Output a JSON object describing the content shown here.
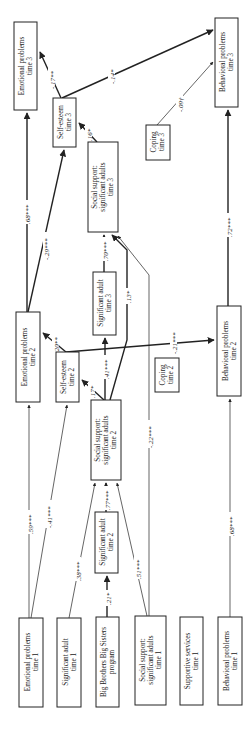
{
  "diagram": {
    "orientation": "rotated 90 degrees counter-clockwise",
    "nodes": [
      {
        "id": "ep3",
        "line1": "Emotional problems",
        "line2": "time 3"
      },
      {
        "id": "se3",
        "line1": "Self-esteem",
        "line2": "time 3"
      },
      {
        "id": "ss3",
        "line1": "Social support:",
        "line2": "significant adults",
        "line3": "time 3"
      },
      {
        "id": "bp3",
        "line1": "Behavioral problems",
        "line2": "time 3"
      },
      {
        "id": "cp3",
        "line1": "Coping",
        "line2": "time 3"
      },
      {
        "id": "ep2",
        "line1": "Emotional problems",
        "line2": "time 2"
      },
      {
        "id": "se2",
        "line1": "Self-esteem",
        "line2": "time 2"
      },
      {
        "id": "sa3",
        "line1": "Significant adult",
        "line2": "time 3"
      },
      {
        "id": "ss2",
        "line1": "Social support:",
        "line2": "significant adults",
        "line3": "time 2"
      },
      {
        "id": "cp2",
        "line1": "Coping",
        "line2": "time 2"
      },
      {
        "id": "bp2",
        "line1": "Behavioral problems",
        "line2": "time 2"
      },
      {
        "id": "sa2",
        "line1": "Significant adult",
        "line2": "time 2"
      },
      {
        "id": "ep1",
        "line1": "Emotional problems",
        "line2": "time 1"
      },
      {
        "id": "sa1",
        "line1": "Significant adult",
        "line2": "time 1"
      },
      {
        "id": "bbbs",
        "line1": "Big Brothers Big Sisters",
        "line2": "program"
      },
      {
        "id": "ss1",
        "line1": "Social support:",
        "line2": "significant adults",
        "line3": "time 1"
      },
      {
        "id": "sv1",
        "line1": "Supportive services",
        "line2": "time 1"
      },
      {
        "id": "bp1",
        "line1": "Behavioral problems",
        "line2": "time 1"
      }
    ],
    "edges": [
      {
        "from": "ep2",
        "to": "ep3",
        "coef": ".68***"
      },
      {
        "from": "ep2",
        "to": "se3",
        "coef": "-.29***"
      },
      {
        "from": "se3",
        "to": "ep3",
        "coef": "-.17**"
      },
      {
        "from": "se3",
        "to": "bp3",
        "coef": "-.14*"
      },
      {
        "from": "ss3",
        "to": "se3",
        "coef": ".16*"
      },
      {
        "from": "cp3",
        "to": "bp3",
        "coef": "-.09†"
      },
      {
        "from": "bp2",
        "to": "bp3",
        "coef": ".72***"
      },
      {
        "from": "sa3",
        "to": "ss3",
        "coef": ".70***"
      },
      {
        "from": "ss2",
        "to": "ss3",
        "coef": ".13*"
      },
      {
        "from": "ss1",
        "to": "ss3",
        "coef": "-.22***"
      },
      {
        "from": "se2",
        "to": "ep2",
        "coef": ".20**"
      },
      {
        "from": "ss2",
        "to": "se2",
        "coef": ".17*"
      },
      {
        "from": "ss2",
        "to": "sa3",
        "coef": ".41***"
      },
      {
        "from": "se2",
        "to": "bp2",
        "coef": "-.21***"
      },
      {
        "from": "ep1",
        "to": "ep2",
        "coef": ".59***"
      },
      {
        "from": "ep1",
        "to": "se2",
        "coef": "-.41***"
      },
      {
        "from": "sa1",
        "to": "ss2",
        "coef": ".38***"
      },
      {
        "from": "sa2",
        "to": "ss2",
        "coef": ".77***"
      },
      {
        "from": "bbbs",
        "to": "sa2",
        "coef": ".21*"
      },
      {
        "from": "ss1",
        "to": "ss2",
        "coef": ".51***"
      },
      {
        "from": "bp1",
        "to": "bp2",
        "coef": ".68***"
      }
    ]
  }
}
